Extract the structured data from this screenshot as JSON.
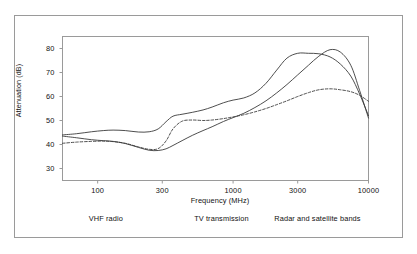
{
  "figure": {
    "background_color": "#ffffff",
    "frame_color": "#9a9a9a",
    "line_color": "#3a3a3a"
  },
  "chart_data": {
    "type": "line",
    "title": "",
    "xlabel": "Frequency (MHz)",
    "ylabel": "Attenuation (dB)",
    "xscale": "log",
    "xlim": [
      55,
      10000
    ],
    "ylim": [
      25,
      85
    ],
    "grid": false,
    "legend": "none",
    "xticks": [
      100,
      300,
      1000,
      3000,
      10000
    ],
    "xtick_labels": [
      "100",
      "300",
      "1000",
      "3000",
      "10000"
    ],
    "yticks": [
      30,
      40,
      50,
      60,
      70,
      80
    ],
    "ytick_labels": [
      "30",
      "40",
      "50",
      "60",
      "70",
      "80"
    ],
    "band_annotations": [
      {
        "label": "VHF radio",
        "center_freq": 115
      },
      {
        "label": "TV transmission",
        "center_freq": 820
      },
      {
        "label": "Radar and satellite bands",
        "center_freq": 4200
      }
    ],
    "series": [
      {
        "name": "upper-solid-curve",
        "style": "solid",
        "x": [
          55,
          70,
          90,
          110,
          130,
          160,
          200,
          240,
          280,
          320,
          360,
          420,
          500,
          600,
          700,
          850,
          1000,
          1200,
          1450,
          1750,
          2100,
          2500,
          3000,
          3600,
          4300,
          5200,
          6200,
          7400,
          8600,
          10000
        ],
        "values": [
          44.0,
          44.5,
          45.3,
          45.8,
          46.0,
          45.8,
          45.2,
          45.3,
          46.5,
          49.5,
          51.8,
          52.6,
          53.4,
          54.4,
          55.6,
          57.4,
          58.5,
          59.4,
          61.5,
          65.5,
          71.0,
          76.0,
          78.0,
          78.0,
          77.8,
          76.5,
          73.5,
          68.5,
          61.0,
          52.0
        ]
      },
      {
        "name": "dashed-curve",
        "style": "dashed",
        "x": [
          55,
          70,
          90,
          110,
          130,
          160,
          200,
          240,
          280,
          320,
          360,
          420,
          500,
          600,
          700,
          850,
          1000,
          1200,
          1450,
          1750,
          2100,
          2500,
          3000,
          3600,
          4300,
          5200,
          6200,
          7400,
          8600,
          10000
        ],
        "values": [
          40.5,
          41.0,
          41.3,
          41.4,
          41.2,
          40.5,
          39.0,
          38.0,
          38.3,
          41.5,
          46.5,
          49.7,
          50.2,
          50.0,
          50.2,
          50.8,
          51.5,
          52.4,
          53.6,
          55.0,
          56.6,
          58.2,
          60.0,
          61.6,
          62.8,
          63.2,
          62.8,
          62.0,
          60.5,
          58.0
        ]
      },
      {
        "name": "lower-solid-curve",
        "style": "solid",
        "x": [
          55,
          70,
          90,
          110,
          130,
          160,
          200,
          240,
          280,
          320,
          360,
          420,
          500,
          600,
          700,
          850,
          1000,
          1200,
          1450,
          1750,
          2100,
          2500,
          3000,
          3600,
          4300,
          5200,
          6200,
          7400,
          8600,
          10000
        ],
        "values": [
          43.5,
          42.8,
          42.0,
          41.6,
          41.3,
          40.4,
          38.8,
          37.6,
          37.5,
          38.2,
          39.6,
          41.6,
          43.8,
          45.8,
          47.4,
          49.6,
          51.2,
          53.0,
          55.4,
          58.2,
          61.5,
          65.0,
          69.0,
          73.0,
          76.8,
          79.5,
          78.5,
          73.0,
          62.5,
          51.0
        ]
      }
    ]
  }
}
